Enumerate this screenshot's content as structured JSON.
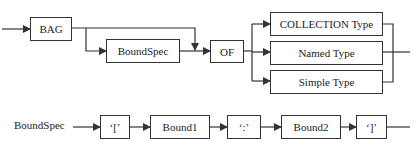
{
  "diagram": {
    "type": "syntax-diagram",
    "top": {
      "start": "BAG",
      "optional": "BoundSpec",
      "keyword": "OF",
      "alternatives": [
        "COLLECTION Type",
        "Named Type",
        "Simple Type"
      ]
    },
    "bottom": {
      "name": "BoundSpec",
      "sequence": [
        "'['",
        "Bound1",
        "':'",
        "Bound2",
        "']'"
      ]
    }
  },
  "labels": {
    "bag": "BAG",
    "boundspec": "BoundSpec",
    "of": "OF",
    "collection_type": "COLLECTION Type",
    "named_type": "Named Type",
    "simple_type": "Simple Type",
    "rule_name": "BoundSpec",
    "open_bracket": "‘[’",
    "bound1": "Bound1",
    "colon": "‘:’",
    "bound2": "Bound2",
    "close_bracket": "‘]’"
  },
  "colors": {
    "line": "#333333",
    "background": "#ffffff"
  }
}
